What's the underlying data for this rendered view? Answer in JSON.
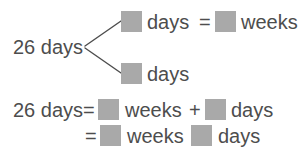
{
  "document": {
    "type": "math-worksheet-diagram",
    "topic": "26 days unit conversion to weeks and days",
    "text_color": "#4d4d4d",
    "blank_color": "#a9a9a9",
    "background_color": "#ffffff"
  },
  "branch": {
    "source_label": "26 days",
    "upper_row": {
      "unit_after_blank": "days",
      "equals": "=",
      "unit_after_second_blank": "weeks"
    },
    "lower_row": {
      "unit_after_blank": "days"
    }
  },
  "equations": [
    {
      "lead": "26 days",
      "equals": "=",
      "unit_1": "weeks",
      "plus": "+",
      "unit_2": "days"
    },
    {
      "equals": "=",
      "unit_1": "weeks",
      "unit_2": "days"
    }
  ]
}
